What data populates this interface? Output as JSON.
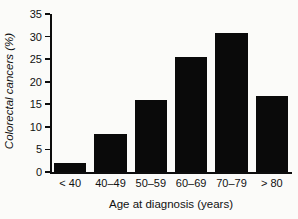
{
  "chart_data": {
    "type": "bar",
    "title": "",
    "xlabel": "Age at diagnosis (years)",
    "ylabel": "Colorectal cancers (%)",
    "categories": [
      "< 40",
      "40–49",
      "50–59",
      "60–69",
      "70–79",
      "> 80"
    ],
    "values": [
      2.0,
      8.4,
      16.0,
      25.4,
      30.9,
      16.8
    ],
    "ylim": [
      0,
      35
    ],
    "yticks": [
      0,
      5,
      10,
      15,
      20,
      25,
      30,
      35
    ],
    "ytick_labels": [
      "0",
      "5",
      "10",
      "15",
      "20",
      "25",
      "30",
      "35"
    ],
    "grid": false,
    "legend": false,
    "bar_color": "#0a0a0a",
    "axis_color": "#0d0d0d",
    "background": "#fbfbf9"
  }
}
